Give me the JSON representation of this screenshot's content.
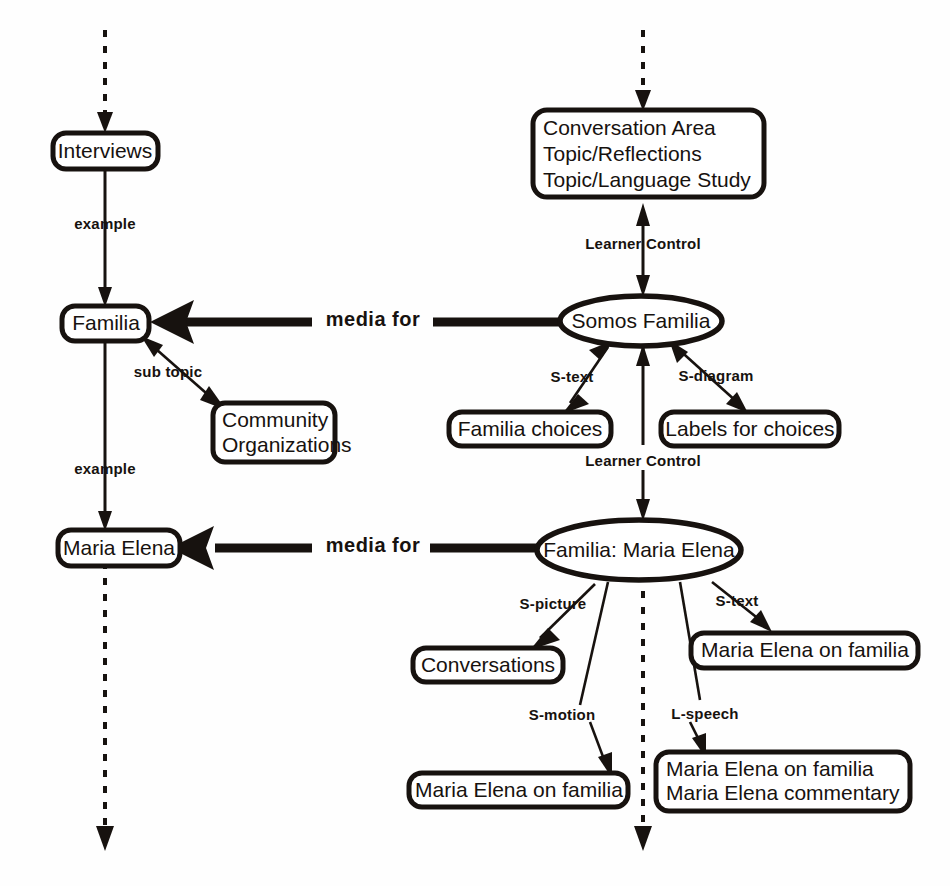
{
  "diagram": {
    "colors": {
      "ink": "#17120f",
      "paper": "#ffffff"
    },
    "nodes": {
      "interviews": {
        "label": "Interviews",
        "shape": "rounded-box"
      },
      "familia": {
        "label": "Familia",
        "shape": "rounded-box"
      },
      "community_organizations": {
        "label_line1": "Community",
        "label_line2": "Organizations",
        "shape": "rounded-box"
      },
      "maria_elena": {
        "label": "Maria Elena",
        "shape": "rounded-box"
      },
      "conversation_area": {
        "label_line1": "Conversation Area",
        "label_line2": "Topic/Reflections",
        "label_line3": "Topic/Language Study",
        "shape": "rounded-box"
      },
      "somos_familia": {
        "label": "Somos Familia",
        "shape": "ellipse"
      },
      "familia_choices": {
        "label": "Familia choices",
        "shape": "rounded-box"
      },
      "labels_for_choices": {
        "label": "Labels for choices",
        "shape": "rounded-box"
      },
      "familia_maria_elena": {
        "label": "Familia: Maria Elena",
        "shape": "ellipse"
      },
      "conversations": {
        "label": "Conversations",
        "shape": "rounded-box"
      },
      "maria_elena_on_familia_text": {
        "label": "Maria Elena on familia",
        "shape": "rounded-box"
      },
      "maria_elena_on_familia_motion": {
        "label": "Maria Elena on familia",
        "shape": "rounded-box"
      },
      "maria_elena_speech": {
        "label_line1": "Maria Elena on familia",
        "label_line2": "Maria Elena commentary",
        "shape": "rounded-box"
      }
    },
    "edge_labels": {
      "example_top": "example",
      "example_bottom": "example",
      "sub_topic": "sub topic",
      "media_for_top": "media for",
      "media_for_bottom": "media for",
      "learner_control_top": "Learner  Control",
      "learner_control_bottom": "Learner  Control",
      "s_text_top": "S-text",
      "s_diagram": "S-diagram",
      "s_picture": "S-picture",
      "s_text_bottom": "S-text",
      "s_motion": "S-motion",
      "l_speech": "L-speech"
    }
  }
}
